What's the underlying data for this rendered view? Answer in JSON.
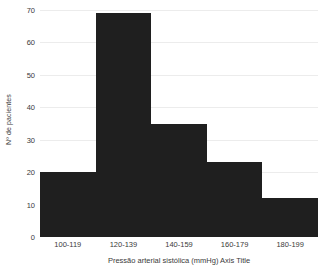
{
  "chart_data": {
    "type": "bar",
    "title": "",
    "subtitle": "",
    "categories": [
      "100-119",
      "120-139",
      "140-159",
      "160-179",
      "180-199"
    ],
    "values": [
      20,
      69,
      35,
      23,
      12
    ],
    "xlabel": "Pressão arterial sistólica (mmHg) Axis Title",
    "ylabel": "Nº de pacientes",
    "ylim": [
      0,
      70
    ],
    "ytick_labels": [
      "0",
      "10",
      "20",
      "30",
      "40",
      "50",
      "60",
      "70"
    ],
    "ytick_values": [
      0,
      10,
      20,
      30,
      40,
      50,
      60,
      70
    ],
    "ytick_step": 10,
    "grid": true,
    "grid_axis": "y",
    "legend": false,
    "legend_position": "none",
    "annotations": [],
    "colors": {
      "bar_fill": "#1f1f1f",
      "gridline": "#ececec",
      "baseline": "#d6d6d6",
      "text": "#3a3a3a",
      "background": "#ffffff"
    }
  }
}
